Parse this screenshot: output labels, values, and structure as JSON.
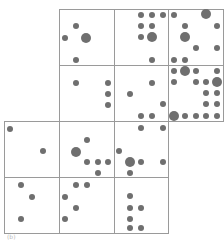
{
  "figure": {
    "caption": "(b)",
    "line_color": "#9a9a9a",
    "dot_color": "#6f6f6f",
    "small_radius": 3,
    "big_radius": 5
  },
  "grid": {
    "cells": [
      {
        "id": "r1c1",
        "x": 59,
        "y": 9,
        "w": 55,
        "h": 56
      },
      {
        "id": "r1c2",
        "x": 114,
        "y": 9,
        "w": 54,
        "h": 56
      },
      {
        "id": "r1c3",
        "x": 168,
        "y": 9,
        "w": 55,
        "h": 56
      },
      {
        "id": "r2c1",
        "x": 59,
        "y": 65,
        "w": 55,
        "h": 56
      },
      {
        "id": "r2c2",
        "x": 114,
        "y": 65,
        "w": 54,
        "h": 56
      },
      {
        "id": "r2c3",
        "x": 168,
        "y": 65,
        "w": 55,
        "h": 56
      },
      {
        "id": "r3c1",
        "x": 4,
        "y": 121,
        "w": 55,
        "h": 56
      },
      {
        "id": "r3c2",
        "x": 59,
        "y": 121,
        "w": 55,
        "h": 56
      },
      {
        "id": "r3c3",
        "x": 114,
        "y": 121,
        "w": 54,
        "h": 56
      },
      {
        "id": "r4c1",
        "x": 4,
        "y": 177,
        "w": 55,
        "h": 56
      },
      {
        "id": "r4c2",
        "x": 59,
        "y": 177,
        "w": 55,
        "h": 56
      },
      {
        "id": "r4c3",
        "x": 114,
        "y": 177,
        "w": 54,
        "h": 56
      }
    ]
  },
  "dots": [
    {
      "x": 76,
      "y": 26,
      "big": false
    },
    {
      "x": 65,
      "y": 38,
      "big": false
    },
    {
      "x": 86,
      "y": 38,
      "big": true
    },
    {
      "x": 76,
      "y": 60,
      "big": false
    },
    {
      "x": 141,
      "y": 15,
      "big": false
    },
    {
      "x": 152,
      "y": 15,
      "big": false
    },
    {
      "x": 163,
      "y": 15,
      "big": false
    },
    {
      "x": 141,
      "y": 26,
      "big": false
    },
    {
      "x": 152,
      "y": 26,
      "big": false
    },
    {
      "x": 141,
      "y": 37,
      "big": false
    },
    {
      "x": 152,
      "y": 37,
      "big": true
    },
    {
      "x": 152,
      "y": 60,
      "big": false
    },
    {
      "x": 174,
      "y": 15,
      "big": false
    },
    {
      "x": 206,
      "y": 14,
      "big": true
    },
    {
      "x": 185,
      "y": 26,
      "big": false
    },
    {
      "x": 217,
      "y": 26,
      "big": false
    },
    {
      "x": 185,
      "y": 37,
      "big": true
    },
    {
      "x": 196,
      "y": 48,
      "big": false
    },
    {
      "x": 217,
      "y": 48,
      "big": false
    },
    {
      "x": 174,
      "y": 60,
      "big": false
    },
    {
      "x": 185,
      "y": 60,
      "big": false
    },
    {
      "x": 76,
      "y": 83,
      "big": false
    },
    {
      "x": 108,
      "y": 83,
      "big": false
    },
    {
      "x": 108,
      "y": 94,
      "big": false
    },
    {
      "x": 108,
      "y": 105,
      "big": false
    },
    {
      "x": 152,
      "y": 83,
      "big": false
    },
    {
      "x": 130,
      "y": 94,
      "big": false
    },
    {
      "x": 163,
      "y": 104,
      "big": false
    },
    {
      "x": 141,
      "y": 116,
      "big": false
    },
    {
      "x": 152,
      "y": 116,
      "big": false
    },
    {
      "x": 174,
      "y": 71,
      "big": false
    },
    {
      "x": 185,
      "y": 71,
      "big": true
    },
    {
      "x": 196,
      "y": 71,
      "big": false
    },
    {
      "x": 217,
      "y": 71,
      "big": false
    },
    {
      "x": 174,
      "y": 82,
      "big": false
    },
    {
      "x": 196,
      "y": 82,
      "big": false
    },
    {
      "x": 206,
      "y": 82,
      "big": false
    },
    {
      "x": 217,
      "y": 82,
      "big": true
    },
    {
      "x": 206,
      "y": 93,
      "big": false
    },
    {
      "x": 217,
      "y": 93,
      "big": false
    },
    {
      "x": 206,
      "y": 104,
      "big": false
    },
    {
      "x": 217,
      "y": 104,
      "big": false
    },
    {
      "x": 174,
      "y": 116,
      "big": true
    },
    {
      "x": 185,
      "y": 116,
      "big": false
    },
    {
      "x": 196,
      "y": 116,
      "big": false
    },
    {
      "x": 206,
      "y": 116,
      "big": false
    },
    {
      "x": 217,
      "y": 116,
      "big": false
    },
    {
      "x": 10,
      "y": 129,
      "big": false
    },
    {
      "x": 43,
      "y": 151,
      "big": false
    },
    {
      "x": 87,
      "y": 140,
      "big": false
    },
    {
      "x": 76,
      "y": 152,
      "big": true
    },
    {
      "x": 87,
      "y": 162,
      "big": false
    },
    {
      "x": 98,
      "y": 162,
      "big": false
    },
    {
      "x": 108,
      "y": 162,
      "big": false
    },
    {
      "x": 98,
      "y": 173,
      "big": false
    },
    {
      "x": 141,
      "y": 128,
      "big": false
    },
    {
      "x": 163,
      "y": 128,
      "big": false
    },
    {
      "x": 119,
      "y": 151,
      "big": false
    },
    {
      "x": 130,
      "y": 162,
      "big": true
    },
    {
      "x": 141,
      "y": 162,
      "big": false
    },
    {
      "x": 163,
      "y": 162,
      "big": false
    },
    {
      "x": 130,
      "y": 173,
      "big": false
    },
    {
      "x": 21,
      "y": 185,
      "big": false
    },
    {
      "x": 32,
      "y": 197,
      "big": false
    },
    {
      "x": 21,
      "y": 219,
      "big": false
    },
    {
      "x": 76,
      "y": 185,
      "big": false
    },
    {
      "x": 87,
      "y": 185,
      "big": false
    },
    {
      "x": 65,
      "y": 197,
      "big": false
    },
    {
      "x": 76,
      "y": 208,
      "big": false
    },
    {
      "x": 65,
      "y": 219,
      "big": false
    },
    {
      "x": 130,
      "y": 196,
      "big": false
    },
    {
      "x": 130,
      "y": 208,
      "big": false
    },
    {
      "x": 141,
      "y": 208,
      "big": false
    },
    {
      "x": 130,
      "y": 219,
      "big": false
    },
    {
      "x": 130,
      "y": 228,
      "big": false
    },
    {
      "x": 141,
      "y": 228,
      "big": false
    }
  ]
}
